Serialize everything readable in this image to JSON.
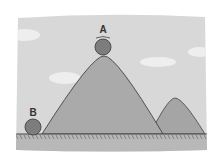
{
  "scene": {
    "description": "Illustration of two balls: ball A balanced on top of a tall hill, ball B resting on flat ground",
    "labels": {
      "ball_a": "A",
      "ball_b": "B"
    },
    "colors": {
      "sky": "#d6d6d6",
      "hill": "#a9a9a9",
      "ground": "#b5b5b5",
      "ball": "#7a7a7a",
      "outline": "#444444"
    }
  }
}
